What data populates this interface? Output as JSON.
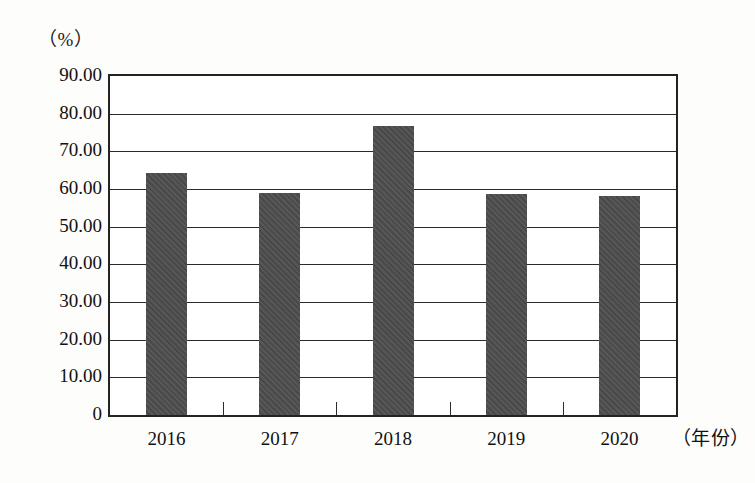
{
  "chart_data": {
    "type": "bar",
    "title": "",
    "subtitle": "",
    "xlabel": "（年份）",
    "ylabel": "（%）",
    "categories": [
      "2016",
      "2017",
      "2018",
      "2019",
      "2020"
    ],
    "values": [
      64.3,
      59.0,
      76.6,
      58.6,
      58.1
    ],
    "series": [
      {
        "name": "",
        "values": [
          64.3,
          59.0,
          76.6,
          58.6,
          58.1
        ]
      }
    ],
    "ylim": [
      0,
      90
    ],
    "ytick_values": [
      0,
      10,
      20,
      30,
      40,
      50,
      60,
      70,
      80,
      90
    ],
    "ytick_labels": [
      "0",
      "10.00",
      "20.00",
      "30.00",
      "40.00",
      "50.00",
      "60.00",
      "70.00",
      "80.00",
      "90.00"
    ],
    "grid": true,
    "grid_axis": "y",
    "legend": false,
    "legend_position": "none",
    "bar_color": "#4d4d4d",
    "plot_background": "#ffffff",
    "axis_color": "#232323",
    "page_background": "#fdfdfb"
  },
  "axes": {
    "unit_label": "（%）",
    "x_axis_title": "（年份）"
  }
}
